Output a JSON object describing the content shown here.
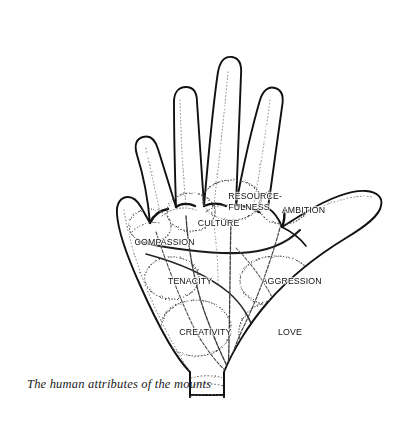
{
  "figure": {
    "title_alt": "The human attributes of the mounts",
    "line_art_color": "#111111",
    "stipple_color": "#5a5a5a",
    "background_color": "#ffffff"
  },
  "top_rule": {
    "color": "#4a4a4c"
  },
  "labels": [
    {
      "id": "resourcefulness",
      "text": "RESOURCE-\nFULNESS",
      "x": 226,
      "y": 190
    },
    {
      "id": "ambition",
      "text": "AMBITION",
      "x": 280,
      "y": 204
    },
    {
      "id": "culture",
      "text": "CULTURE",
      "x": 196,
      "y": 217
    },
    {
      "id": "compassion",
      "text": "COMPASSION",
      "x": 132,
      "y": 236
    },
    {
      "id": "tenacity",
      "text": "TENACITY",
      "x": 166,
      "y": 275
    },
    {
      "id": "aggression",
      "text": "AGGRESSION",
      "x": 259,
      "y": 275
    },
    {
      "id": "creativity",
      "text": "CREATIVITY",
      "x": 177,
      "y": 326
    },
    {
      "id": "love",
      "text": "LOVE",
      "x": 277,
      "y": 326
    }
  ],
  "caption": {
    "line1": "The human attributes of the",
    "line2": "mounts"
  }
}
